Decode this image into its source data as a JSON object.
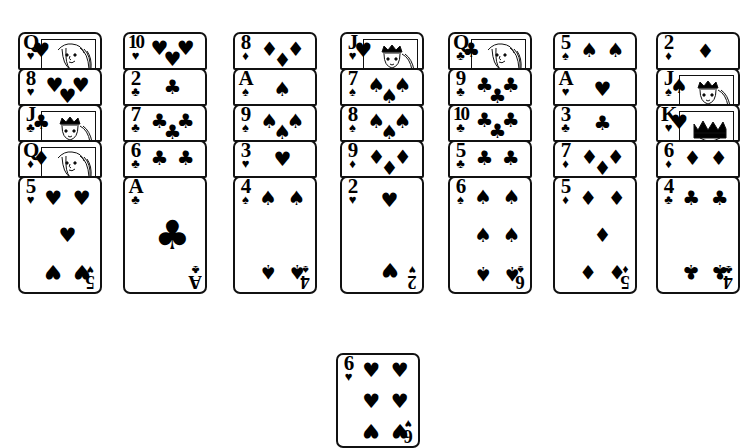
{
  "app": {
    "title": "Solitaire Card Tableau",
    "background_color": "#ffffff",
    "ink_color": "#000000"
  },
  "suit_glyphs": {
    "hearts": "♥",
    "diamonds": "♦",
    "clubs": "♣",
    "spades": "♠"
  },
  "tableau": {
    "column_count": 7,
    "columns": [
      {
        "name": "column-1",
        "cards": [
          {
            "rank": "Q",
            "suit": "hearts",
            "court": true,
            "face_up": true
          },
          {
            "rank": "8",
            "suit": "hearts",
            "court": false,
            "face_up": true
          },
          {
            "rank": "J",
            "suit": "clubs",
            "court": true,
            "face_up": true
          },
          {
            "rank": "Q",
            "suit": "diamonds",
            "court": true,
            "face_up": true
          },
          {
            "rank": "5",
            "suit": "hearts",
            "court": false,
            "face_up": true
          }
        ]
      },
      {
        "name": "column-2",
        "cards": [
          {
            "rank": "10",
            "suit": "hearts",
            "court": false,
            "face_up": true
          },
          {
            "rank": "2",
            "suit": "clubs",
            "court": false,
            "face_up": true
          },
          {
            "rank": "7",
            "suit": "clubs",
            "court": false,
            "face_up": true
          },
          {
            "rank": "6",
            "suit": "clubs",
            "court": false,
            "face_up": true
          },
          {
            "rank": "A",
            "suit": "clubs",
            "court": false,
            "face_up": true
          }
        ]
      },
      {
        "name": "column-3",
        "cards": [
          {
            "rank": "8",
            "suit": "diamonds",
            "court": false,
            "face_up": true
          },
          {
            "rank": "A",
            "suit": "spades",
            "court": false,
            "face_up": true
          },
          {
            "rank": "9",
            "suit": "spades",
            "court": false,
            "face_up": true
          },
          {
            "rank": "3",
            "suit": "hearts",
            "court": false,
            "face_up": true
          },
          {
            "rank": "4",
            "suit": "spades",
            "court": false,
            "face_up": true
          }
        ]
      },
      {
        "name": "column-4",
        "cards": [
          {
            "rank": "J",
            "suit": "hearts",
            "court": true,
            "face_up": true
          },
          {
            "rank": "7",
            "suit": "spades",
            "court": false,
            "face_up": true
          },
          {
            "rank": "8",
            "suit": "spades",
            "court": false,
            "face_up": true
          },
          {
            "rank": "9",
            "suit": "diamonds",
            "court": false,
            "face_up": true
          },
          {
            "rank": "2",
            "suit": "hearts",
            "court": false,
            "face_up": true
          }
        ]
      },
      {
        "name": "column-5",
        "cards": [
          {
            "rank": "Q",
            "suit": "clubs",
            "court": true,
            "face_up": true
          },
          {
            "rank": "9",
            "suit": "clubs",
            "court": false,
            "face_up": true
          },
          {
            "rank": "10",
            "suit": "clubs",
            "court": false,
            "face_up": true
          },
          {
            "rank": "5",
            "suit": "clubs",
            "court": false,
            "face_up": true
          },
          {
            "rank": "6",
            "suit": "spades",
            "court": false,
            "face_up": true
          }
        ]
      },
      {
        "name": "column-6",
        "cards": [
          {
            "rank": "5",
            "suit": "spades",
            "court": false,
            "face_up": true
          },
          {
            "rank": "A",
            "suit": "hearts",
            "court": false,
            "face_up": true
          },
          {
            "rank": "3",
            "suit": "clubs",
            "court": false,
            "face_up": true
          },
          {
            "rank": "7",
            "suit": "diamonds",
            "court": false,
            "face_up": true
          },
          {
            "rank": "5",
            "suit": "diamonds",
            "court": false,
            "face_up": true
          }
        ]
      },
      {
        "name": "column-7",
        "cards": [
          {
            "rank": "2",
            "suit": "diamonds",
            "court": false,
            "face_up": true
          },
          {
            "rank": "J",
            "suit": "spades",
            "court": true,
            "face_up": true
          },
          {
            "rank": "K",
            "suit": "hearts",
            "court": true,
            "face_up": true
          },
          {
            "rank": "6",
            "suit": "diamonds",
            "court": false,
            "face_up": true
          },
          {
            "rank": "4",
            "suit": "clubs",
            "court": false,
            "face_up": true
          }
        ]
      }
    ]
  },
  "free_cell": {
    "name": "free-card",
    "card": {
      "rank": "6",
      "suit": "hearts",
      "court": false,
      "face_up": true
    }
  },
  "geometry": {
    "column_xs": [
      18,
      123,
      233,
      340,
      448,
      553,
      656
    ],
    "column_top": 32,
    "stack_offset": 36,
    "card_width": 84,
    "covered_height": 38,
    "bottom_height": 118,
    "free_card_x": 336,
    "free_card_y": 353
  }
}
